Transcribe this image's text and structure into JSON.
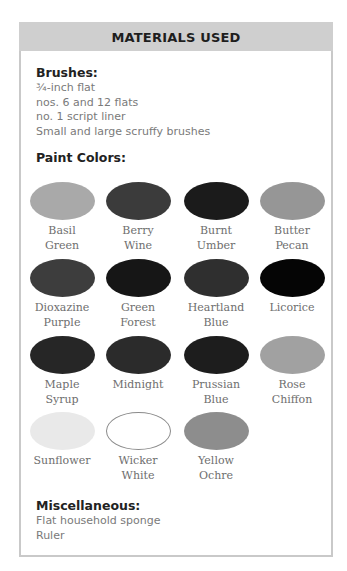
{
  "header": {
    "title": "MATERIALS USED"
  },
  "brushes": {
    "heading": "Brushes:",
    "items": [
      "¾-inch flat",
      "nos. 6 and 12 flats",
      "no. 1 script liner",
      "Small and large scruffy brushes"
    ]
  },
  "paint_colors": {
    "heading": "Paint Colors:",
    "swatches": [
      {
        "line1": "Basil",
        "line2": "Green",
        "color": "#a9a9a9"
      },
      {
        "line1": "Berry",
        "line2": "Wine",
        "color": "#3b3b3b"
      },
      {
        "line1": "Burnt",
        "line2": "Umber",
        "color": "#1b1b1b"
      },
      {
        "line1": "Butter",
        "line2": "Pecan",
        "color": "#969696"
      },
      {
        "line1": "Dioxazine",
        "line2": "Purple",
        "color": "#3d3d3d"
      },
      {
        "line1": "Green",
        "line2": "Forest",
        "color": "#161616"
      },
      {
        "line1": "Heartland",
        "line2": "Blue",
        "color": "#2f2f2f"
      },
      {
        "line1": "Licorice",
        "line2": "",
        "color": "#050505"
      },
      {
        "line1": "Maple",
        "line2": "Syrup",
        "color": "#262626"
      },
      {
        "line1": "Midnight",
        "line2": "",
        "color": "#2b2b2b"
      },
      {
        "line1": "Prussian",
        "line2": "Blue",
        "color": "#1d1d1d"
      },
      {
        "line1": "Rose",
        "line2": "Chiffon",
        "color": "#a1a1a1"
      },
      {
        "line1": "Sunflower",
        "line2": "",
        "color": "#e9e9e9"
      },
      {
        "line1": "Wicker",
        "line2": "White",
        "color": "#ffffff"
      },
      {
        "line1": "Yellow",
        "line2": "Ochre",
        "color": "#8d8d8d"
      }
    ]
  },
  "miscellaneous": {
    "heading": "Miscellaneous:",
    "items": [
      "Flat household sponge",
      "Ruler"
    ]
  }
}
